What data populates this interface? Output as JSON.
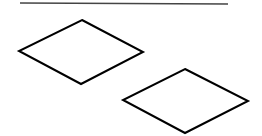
{
  "canvas": {
    "width": 262,
    "height": 136,
    "background": "#ffffff"
  },
  "line": {
    "x1": 20,
    "y1": 3,
    "x2": 228,
    "y2": 4,
    "stroke": "#444444",
    "stroke_width": 1.5
  },
  "shapes": [
    {
      "type": "rhombus",
      "points": [
        [
          82,
          20
        ],
        [
          143,
          52
        ],
        [
          81,
          84
        ],
        [
          19,
          51
        ]
      ],
      "stroke": "#000000",
      "stroke_width": 2,
      "fill": "none"
    },
    {
      "type": "rhombus",
      "points": [
        [
          185,
          69
        ],
        [
          248,
          101
        ],
        [
          185,
          133
        ],
        [
          123,
          100
        ]
      ],
      "stroke": "#000000",
      "stroke_width": 2,
      "fill": "none"
    }
  ]
}
